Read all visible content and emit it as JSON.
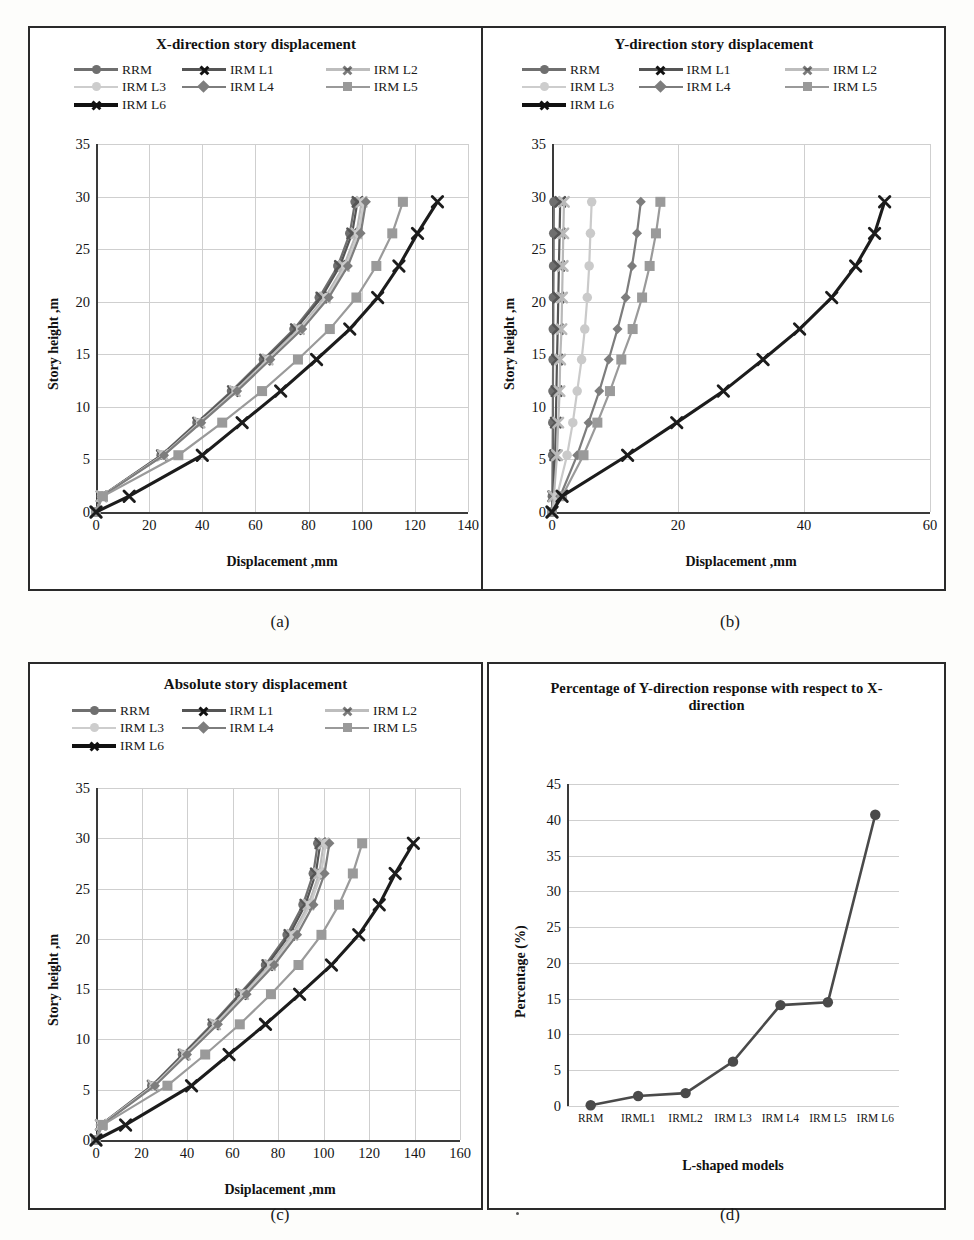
{
  "figure": {
    "captions": [
      "(a)",
      "(b)",
      "(c)",
      "(d)"
    ]
  },
  "legend_labels": [
    "RRM",
    "IRM L1",
    "IRM L2",
    "IRM L3",
    "IRM L4",
    "IRM L5",
    "IRM L6"
  ],
  "series_styles": [
    {
      "name": "RRM",
      "color": "#6f6f6f",
      "marker": "circle"
    },
    {
      "name": "IRM L1",
      "color": "#555555",
      "marker": "x"
    },
    {
      "name": "IRM L2",
      "color": "#b9b9b9",
      "marker": "x"
    },
    {
      "name": "IRM L3",
      "color": "#cacaca",
      "marker": "circle"
    },
    {
      "name": "IRM L4",
      "color": "#7d7d7d",
      "marker": "diamond"
    },
    {
      "name": "IRM L5",
      "color": "#9a9a9a",
      "marker": "square"
    },
    {
      "name": "IRM L6",
      "color": "#1c1c1c",
      "marker": "x"
    }
  ],
  "chart_data": [
    {
      "id": "a",
      "type": "line",
      "title": "X-direction story displacement",
      "xlabel": "Displacement  ,mm",
      "ylabel": "Story height ,m",
      "xlim": [
        0,
        140
      ],
      "ylim": [
        0,
        35
      ],
      "xticks": [
        0,
        20,
        40,
        60,
        80,
        100,
        120,
        140
      ],
      "yticks": [
        0,
        5,
        10,
        15,
        20,
        25,
        30,
        35
      ],
      "grid": true,
      "legend_position": "top",
      "story_heights": [
        0,
        1.5,
        5.4,
        8.5,
        11.5,
        14.5,
        17.4,
        20.4,
        23.4,
        26.5,
        29.5
      ],
      "series": [
        {
          "name": "RRM",
          "values": [
            0,
            2.0,
            24.5,
            38.0,
            51.0,
            63.0,
            74.5,
            84.0,
            91.0,
            95.5,
            97.5
          ]
        },
        {
          "name": "IRM L1",
          "values": [
            0,
            2.1,
            24.8,
            38.4,
            51.5,
            63.6,
            75.2,
            84.8,
            91.8,
            96.4,
            98.4
          ]
        },
        {
          "name": "IRM L2",
          "values": [
            0,
            2.2,
            25.2,
            39.0,
            52.3,
            64.6,
            76.4,
            86.2,
            93.3,
            98.0,
            100.0
          ]
        },
        {
          "name": "IRM L3",
          "values": [
            0,
            2.2,
            25.4,
            39.3,
            52.7,
            65.1,
            77.0,
            86.9,
            94.0,
            98.8,
            100.8
          ]
        },
        {
          "name": "IRM L4",
          "values": [
            0,
            2.3,
            25.6,
            39.6,
            53.1,
            65.6,
            77.6,
            87.6,
            94.8,
            99.6,
            101.6
          ]
        },
        {
          "name": "IRM L5",
          "values": [
            0,
            2.6,
            31.0,
            47.5,
            62.5,
            76.0,
            88.0,
            98.0,
            105.5,
            111.5,
            115.5
          ]
        },
        {
          "name": "IRM L6",
          "values": [
            0,
            12.5,
            40.0,
            55.0,
            69.5,
            83.0,
            95.5,
            106.0,
            114.0,
            121.0,
            128.5
          ]
        }
      ]
    },
    {
      "id": "b",
      "type": "line",
      "title": "Y-direction story displacement",
      "xlabel": "Displacement  ,mm",
      "ylabel": "Story height ,m",
      "xlim": [
        0,
        60
      ],
      "ylim": [
        0,
        35
      ],
      "xticks": [
        0,
        20,
        40,
        60
      ],
      "yticks": [
        0,
        5,
        10,
        15,
        20,
        25,
        30,
        35
      ],
      "grid": true,
      "legend_position": "top",
      "story_heights": [
        0,
        1.5,
        5.4,
        8.5,
        11.5,
        14.5,
        17.4,
        20.4,
        23.4,
        26.5,
        29.5
      ],
      "series": [
        {
          "name": "RRM",
          "values": [
            0,
            0.05,
            0.1,
            0.12,
            0.15,
            0.17,
            0.2,
            0.22,
            0.25,
            0.27,
            0.3
          ]
        },
        {
          "name": "IRM L1",
          "values": [
            0,
            0.2,
            0.5,
            0.6,
            0.7,
            0.8,
            0.9,
            1.0,
            1.1,
            1.2,
            1.3
          ]
        },
        {
          "name": "IRM L2",
          "values": [
            0,
            0.3,
            0.8,
            1.0,
            1.2,
            1.3,
            1.5,
            1.6,
            1.7,
            1.8,
            1.9
          ]
        },
        {
          "name": "IRM L3",
          "values": [
            0,
            0.8,
            2.4,
            3.3,
            4.0,
            4.7,
            5.2,
            5.6,
            5.9,
            6.1,
            6.3
          ]
        },
        {
          "name": "IRM L4",
          "values": [
            0,
            1.3,
            4.0,
            5.8,
            7.5,
            9.0,
            10.4,
            11.7,
            12.7,
            13.5,
            14.1
          ]
        },
        {
          "name": "IRM L5",
          "values": [
            0,
            1.6,
            5.0,
            7.2,
            9.2,
            11.0,
            12.8,
            14.3,
            15.5,
            16.5,
            17.2
          ]
        },
        {
          "name": "IRM L6",
          "values": [
            0,
            1.6,
            12.0,
            19.8,
            27.2,
            33.5,
            39.3,
            44.4,
            48.2,
            51.2,
            52.8
          ]
        }
      ]
    },
    {
      "id": "c",
      "type": "line",
      "title": "Absolute story displacement",
      "xlabel": "Dsiplacement  ,mm",
      "ylabel": "Story height ,m",
      "xlim": [
        0,
        160
      ],
      "ylim": [
        0,
        35
      ],
      "xticks": [
        0,
        20,
        40,
        60,
        80,
        100,
        120,
        140,
        160
      ],
      "yticks": [
        0,
        5,
        10,
        15,
        20,
        25,
        30,
        35
      ],
      "grid": true,
      "legend_position": "top",
      "story_heights": [
        0,
        1.5,
        5.4,
        8.5,
        11.5,
        14.5,
        17.4,
        20.4,
        23.4,
        26.5,
        29.5
      ],
      "series": [
        {
          "name": "RRM",
          "values": [
            0,
            2.0,
            24.5,
            38.0,
            51.0,
            63.0,
            74.5,
            84.0,
            91.0,
            95.5,
            97.5
          ]
        },
        {
          "name": "IRM L1",
          "values": [
            0,
            2.1,
            24.9,
            38.5,
            51.6,
            63.7,
            75.3,
            85.0,
            92.0,
            96.6,
            98.6
          ]
        },
        {
          "name": "IRM L2",
          "values": [
            0,
            2.2,
            25.3,
            39.1,
            52.4,
            64.7,
            76.5,
            86.3,
            93.4,
            98.1,
            100.1
          ]
        },
        {
          "name": "IRM L3",
          "values": [
            0,
            2.3,
            25.5,
            39.5,
            52.9,
            65.3,
            77.2,
            87.1,
            94.2,
            99.0,
            101.0
          ]
        },
        {
          "name": "IRM L4",
          "values": [
            0,
            2.6,
            25.9,
            40.0,
            53.6,
            66.2,
            78.3,
            88.4,
            95.6,
            100.5,
            102.6
          ]
        },
        {
          "name": "IRM L5",
          "values": [
            0,
            3.0,
            31.4,
            48.0,
            63.2,
            76.9,
            89.0,
            99.1,
            106.8,
            112.9,
            117.0
          ]
        },
        {
          "name": "IRM L6",
          "values": [
            0,
            13.0,
            42.0,
            58.5,
            74.5,
            89.5,
            103.5,
            115.5,
            124.5,
            131.5,
            139.5
          ]
        }
      ]
    },
    {
      "id": "d",
      "type": "line",
      "title": "Percentage of Y-direction response with respect to X-direction",
      "xlabel": "L-shaped models",
      "ylabel": "Percentage (%)",
      "categories": [
        "RRM",
        "IRML1",
        "IRML2",
        "IRM L3",
        "IRM L4",
        "IRM L5",
        "IRM L6"
      ],
      "values": [
        0.1,
        1.4,
        1.8,
        6.2,
        14.1,
        14.5,
        40.7
      ],
      "ylim": [
        0,
        45
      ],
      "yticks": [
        0,
        5,
        10,
        15,
        20,
        25,
        30,
        35,
        40,
        45
      ],
      "grid": true,
      "line_color": "#4a4a4a",
      "marker": "circle"
    }
  ]
}
